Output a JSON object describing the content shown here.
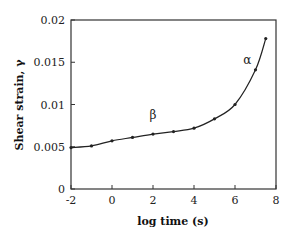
{
  "chart_data": {
    "type": "line",
    "title": "",
    "xlabel": "log time (s)",
    "ylabel": "Shear strain, γ",
    "xlim": [
      -2,
      8
    ],
    "ylim": [
      0,
      0.02
    ],
    "xticks": [
      "-2",
      "0",
      "2",
      "4",
      "6",
      "8"
    ],
    "yticks": [
      "0",
      "0.005",
      "0.01",
      "0.015",
      "0.02"
    ],
    "grid": false,
    "legend": null,
    "series": [
      {
        "name": "shear strain",
        "x": [
          -2,
          -1,
          0,
          1,
          2,
          3,
          4,
          5,
          6,
          7,
          7.5
        ],
        "y": [
          0.0049,
          0.0051,
          0.0057,
          0.0061,
          0.0065,
          0.0068,
          0.0072,
          0.0083,
          0.01,
          0.0141,
          0.0178
        ]
      }
    ],
    "annotations": [
      {
        "text": "β",
        "x": 2.0,
        "y": 0.0083
      },
      {
        "text": "α",
        "x": 6.6,
        "y": 0.0148
      }
    ]
  }
}
